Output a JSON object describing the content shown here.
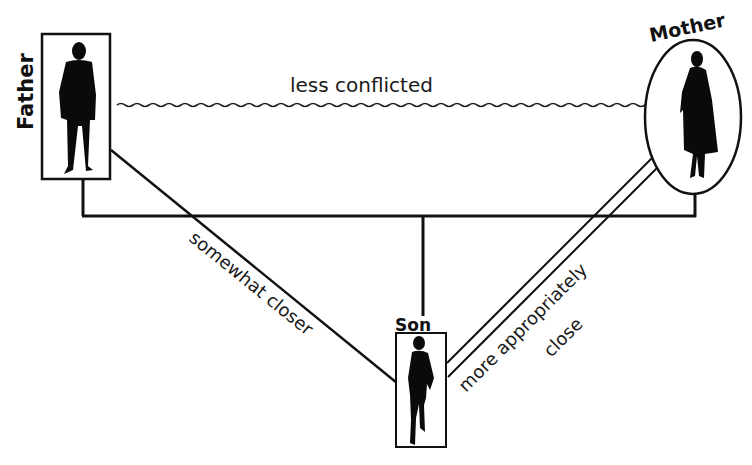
{
  "diagram": {
    "type": "family-relationship-triangle",
    "nodes": [
      {
        "id": "father",
        "label": "Father",
        "shape": "rectangle",
        "figure": "man-silhouette"
      },
      {
        "id": "mother",
        "label": "Mother",
        "shape": "ellipse",
        "figure": "woman-silhouette"
      },
      {
        "id": "son",
        "label": "Son",
        "shape": "rectangle",
        "figure": "boy-silhouette"
      }
    ],
    "edges": [
      {
        "from": "father",
        "to": "mother",
        "style": "wavy",
        "label": "less conflicted"
      },
      {
        "from": "father",
        "to": "son",
        "style": "single-line",
        "label": "somewhat closer"
      },
      {
        "from": "mother",
        "to": "son",
        "style": "double-line",
        "label_line1": "more appropriately",
        "label_line2": "close"
      },
      {
        "from": "father-mother",
        "to": "son",
        "style": "genogram-bracket",
        "label": ""
      }
    ],
    "colors": {
      "ink": "#111111",
      "background": "#ffffff"
    }
  }
}
